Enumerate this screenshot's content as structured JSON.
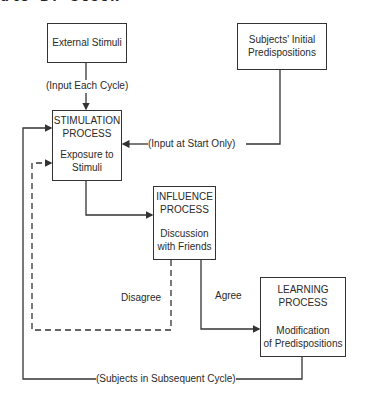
{
  "header": {
    "cropped_text": "ule B. Stock"
  },
  "nodes": {
    "external": {
      "label": "External Stimuli"
    },
    "subjects": {
      "line1": "Subjects' Initial",
      "line2": "Predispositions"
    },
    "stimulation": {
      "title1": "STIMULATION",
      "title2": "PROCESS",
      "sub1": "Exposure to",
      "sub2": "Stimuli"
    },
    "influence": {
      "title1": "INFLUENCE",
      "title2": "PROCESS",
      "sub1": "Discussion",
      "sub2": "with Friends"
    },
    "learning": {
      "title1": "LEARNING",
      "title2": "PROCESS",
      "sub1": "Modification",
      "sub2": "of Predispositions"
    }
  },
  "edges": {
    "input_each_cycle": "(Input Each Cycle)",
    "input_at_start": "(Input at Start Only)",
    "disagree": "Disagree",
    "agree": "Agree",
    "subsequent_cycle": "(Subjects in Subsequent Cycle)"
  },
  "colors": {
    "line": "#333333",
    "background": "#ffffff",
    "text": "#2a2a2a"
  }
}
